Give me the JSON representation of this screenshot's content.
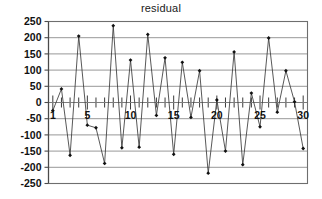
{
  "chart_data": {
    "type": "line",
    "title": "residual",
    "xlabel": "",
    "ylabel": "",
    "x": [
      1,
      2,
      3,
      4,
      5,
      6,
      7,
      8,
      9,
      10,
      11,
      12,
      13,
      14,
      15,
      16,
      17,
      18,
      19,
      20,
      21,
      22,
      23,
      24,
      25,
      26,
      27,
      28,
      29,
      30
    ],
    "values": [
      -25,
      42,
      -163,
      205,
      -70,
      -78,
      -188,
      237,
      -140,
      131,
      -138,
      210,
      -40,
      138,
      -160,
      124,
      -46,
      98,
      -218,
      8,
      -150,
      156,
      -192,
      29,
      -75,
      199,
      -30,
      98,
      2,
      -142
    ],
    "series": [
      {
        "name": "residual",
        "values": [
          -25,
          42,
          -163,
          205,
          -70,
          -78,
          -188,
          237,
          -140,
          131,
          -138,
          210,
          -40,
          138,
          -160,
          124,
          -46,
          98,
          -218,
          8,
          -150,
          156,
          -192,
          29,
          -75,
          199,
          -30,
          98,
          2,
          -142
        ]
      }
    ],
    "ylim": [
      -250,
      250
    ],
    "xlim": [
      0.5,
      30.5
    ],
    "yticks": [
      250,
      200,
      150,
      100,
      50,
      0,
      -50,
      -100,
      -150,
      -200,
      -250
    ],
    "ytick_labels": [
      "250",
      "200",
      "150",
      "100",
      "50",
      "0",
      "-50",
      "-100",
      "-150",
      "-200",
      "-250"
    ],
    "xticks": [
      1,
      5,
      10,
      15,
      20,
      25,
      30
    ],
    "xtick_labels": [
      "1",
      "5",
      "10",
      "15",
      "20",
      "25",
      "30"
    ],
    "xtick_minor": [
      2,
      3,
      4,
      6,
      7,
      8,
      9,
      11,
      12,
      13,
      14,
      16,
      17,
      18,
      19,
      21,
      22,
      23,
      24,
      26,
      27,
      28,
      29
    ],
    "grid": true,
    "legend": false,
    "marker": "diamond",
    "line_color": "#3a3a3a",
    "marker_color": "#111111",
    "grid_color": "#8c8c8c",
    "background": "#ffffff"
  }
}
